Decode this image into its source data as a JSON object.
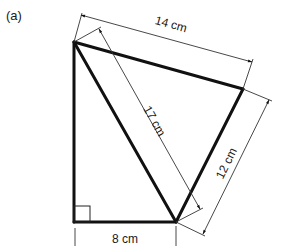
{
  "part_label": "(a)",
  "shape": {
    "description": "Quadrilateral made of a right triangle and a second triangle sharing a 17 cm diagonal",
    "vertices": {
      "A": [
        74,
        42
      ],
      "B": [
        243,
        89
      ],
      "C": [
        176,
        222
      ],
      "D": [
        74,
        222
      ]
    },
    "right_angle_at": "D"
  },
  "dimensions": {
    "top": {
      "label": "14 cm",
      "from": "A",
      "to": "B"
    },
    "diagonal": {
      "label": "17 cm",
      "from": "A",
      "to": "C"
    },
    "right": {
      "label": "12 cm",
      "from": "B",
      "to": "C"
    },
    "bottom": {
      "label": "8 cm",
      "from": "D",
      "to": "C"
    }
  },
  "colors": {
    "line": "#111111",
    "dim_line": "#333333",
    "background": "#ffffff"
  }
}
